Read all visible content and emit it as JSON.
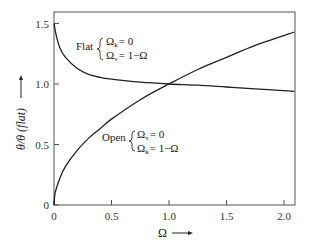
{
  "chart_data": {
    "type": "line",
    "title": "",
    "xlabel": "Ω",
    "ylabel": "θ/θ (flat)",
    "xlim": [
      0,
      2.09
    ],
    "ylim": [
      0,
      1.6
    ],
    "xticks": [
      0,
      0.5,
      1.0,
      1.5,
      2.0
    ],
    "xtick_labels": [
      "0",
      "0.5",
      "1.0",
      "1.5",
      "2.0"
    ],
    "yticks": [
      0,
      0.5,
      1.0,
      1.5
    ],
    "ytick_labels": [
      "0",
      "0.5",
      "1.0",
      "1.5"
    ],
    "grid": false,
    "series": [
      {
        "name": "Flat",
        "annotation": [
          "Ω_k = 0",
          "Ω_v = 1−Ω"
        ],
        "x": [
          0.0,
          0.02,
          0.05,
          0.1,
          0.2,
          0.3,
          0.4,
          0.5,
          0.75,
          1.0,
          1.25,
          1.5,
          1.75,
          2.09
        ],
        "y": [
          1.5,
          1.4,
          1.3,
          1.22,
          1.13,
          1.08,
          1.055,
          1.04,
          1.015,
          1.0,
          0.99,
          0.975,
          0.96,
          0.94
        ]
      },
      {
        "name": "Open",
        "annotation": [
          "Ω_v = 0",
          "Ω_k = 1−Ω"
        ],
        "x": [
          0.0,
          0.01,
          0.05,
          0.1,
          0.2,
          0.3,
          0.4,
          0.5,
          0.75,
          1.0,
          1.25,
          1.5,
          1.75,
          2.09
        ],
        "y": [
          0.0,
          0.1,
          0.22,
          0.32,
          0.45,
          0.55,
          0.63,
          0.71,
          0.87,
          1.0,
          1.12,
          1.22,
          1.32,
          1.43
        ]
      }
    ]
  },
  "labels": {
    "flat_name": "Flat",
    "flat_line1_sym": "Ω",
    "flat_line1_sub": "k",
    "flat_line1_rest": "= 0",
    "flat_line2_sym": "Ω",
    "flat_line2_sub": "v",
    "flat_line2_rest": "= 1−Ω",
    "open_name": "Open",
    "open_line1_sym": "Ω",
    "open_line1_sub": "v",
    "open_line1_rest": "= 0",
    "open_line2_sym": "Ω",
    "open_line2_sub": "k",
    "open_line2_rest": "= 1−Ω",
    "xlabel": "Ω",
    "ylabel": "θ/θ (flat)"
  }
}
